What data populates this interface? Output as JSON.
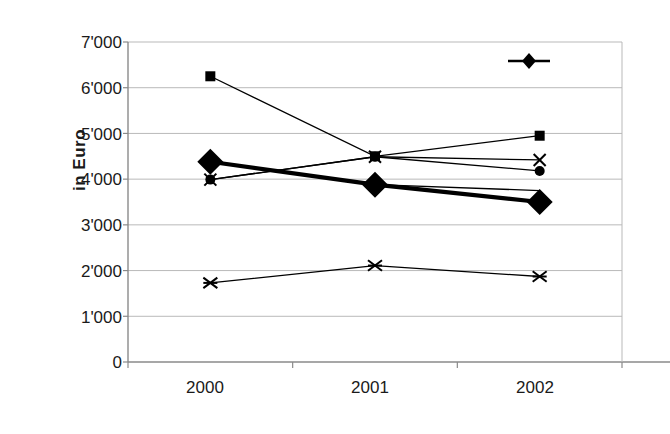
{
  "chart_data": {
    "type": "line",
    "title": "",
    "xlabel": "",
    "ylabel": "in Euro",
    "categories": [
      "2000",
      "2001",
      "2002"
    ],
    "ylim": [
      0,
      7000
    ],
    "ytick_labels": [
      "0",
      "1'000",
      "2'000",
      "3'000",
      "4'000",
      "5'000",
      "6'000",
      "7'000"
    ],
    "ytick_values": [
      0,
      1000,
      2000,
      3000,
      4000,
      5000,
      6000,
      7000
    ],
    "grid": "horizontal",
    "legend_position": "top-right",
    "series": [
      {
        "name": "Linz",
        "marker": "diamond",
        "emphasis": "bold",
        "values": [
          4380,
          3880,
          3500
        ]
      },
      {
        "name": "series-square",
        "marker": "square",
        "emphasis": "normal",
        "values": [
          6250,
          4500,
          4950
        ]
      },
      {
        "name": "series-cross",
        "marker": "x",
        "emphasis": "normal",
        "values": [
          3990,
          4490,
          4420
        ]
      },
      {
        "name": "series-circle",
        "marker": "circle",
        "emphasis": "normal",
        "values": [
          3990,
          4490,
          4180
        ]
      },
      {
        "name": "series-thin-diamond",
        "marker": "none",
        "emphasis": "normal",
        "values": [
          4380,
          3880,
          3750
        ]
      },
      {
        "name": "series-asterisk",
        "marker": "asterisk",
        "emphasis": "normal",
        "values": [
          1730,
          2110,
          1870
        ]
      }
    ]
  },
  "legend": {
    "entries": [
      {
        "label": "Linz",
        "marker": "diamond"
      }
    ]
  },
  "axes": {
    "y_title": "in Euro",
    "y_labels": [
      "7'000",
      "6'000",
      "5'000",
      "4'000",
      "3'000",
      "2'000",
      "1'000",
      "0"
    ],
    "x_labels": [
      "2000",
      "2001",
      "2002"
    ]
  },
  "colors": {
    "series": "#000000",
    "grid": "#b9b9b9",
    "axis": "#8a8a8a",
    "text": "#1a1a1a",
    "background": "#ffffff"
  }
}
